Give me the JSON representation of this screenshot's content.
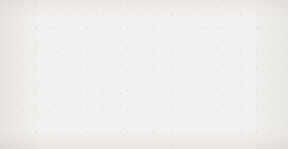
{
  "figure": {
    "kind": "directed-graphical-model",
    "background_color": "#f3f1ef",
    "edge_color": "#3a3a3a",
    "node_stroke_color": "#5a5a5a",
    "node_fill_observed": "#a9a9a9",
    "node_fill_hidden": "#fdfcfb",
    "label_color": "#1a1a1a",
    "width": 288,
    "height": 149
  },
  "layers": {
    "top": {
      "name": "state-layer",
      "center_y": 31,
      "radius": 21,
      "nodes": [
        {
          "id": "s1",
          "base": "s",
          "sub": "1",
          "cx": 29,
          "shaded": false
        },
        {
          "id": "s2",
          "base": "s",
          "sub": "2",
          "cx": 86,
          "shaded": false
        },
        {
          "id": "s3",
          "base": "s",
          "sub": "3",
          "cx": 145,
          "shaded": true
        },
        {
          "id": "s4",
          "base": "s",
          "sub": "4",
          "cx": 202,
          "shaded": false
        },
        {
          "id": "s5",
          "base": "s",
          "sub": "5",
          "cx": 259,
          "shaded": false
        }
      ]
    },
    "bottom": {
      "name": "observation-layer",
      "center_y": 124,
      "radius": 20,
      "nodes": [
        {
          "id": "x1",
          "base": "x",
          "sub": "1",
          "cx": 29,
          "shaded": false
        },
        {
          "id": "x2",
          "base": "x",
          "sub": "2",
          "cx": 86,
          "shaded": true
        },
        {
          "id": "x3",
          "base": "x",
          "sub": "3",
          "cx": 145,
          "shaded": true
        },
        {
          "id": "x4",
          "base": "x",
          "sub": "4",
          "cx": 202,
          "shaded": true
        },
        {
          "id": "x5",
          "base": "x",
          "sub": "5",
          "cx": 259,
          "shaded": false
        }
      ]
    }
  },
  "edges": [
    {
      "from": "x1",
      "to": "s1"
    },
    {
      "from": "x1",
      "to": "s2"
    },
    {
      "from": "x2",
      "to": "s1"
    },
    {
      "from": "x2",
      "to": "s2"
    },
    {
      "from": "x2",
      "to": "s3"
    },
    {
      "from": "x3",
      "to": "s2"
    },
    {
      "from": "x3",
      "to": "s3"
    },
    {
      "from": "x3",
      "to": "s4"
    },
    {
      "from": "x4",
      "to": "s3"
    },
    {
      "from": "x4",
      "to": "s4"
    },
    {
      "from": "x4",
      "to": "s5"
    },
    {
      "from": "x5",
      "to": "s4"
    },
    {
      "from": "x5",
      "to": "s5"
    }
  ]
}
